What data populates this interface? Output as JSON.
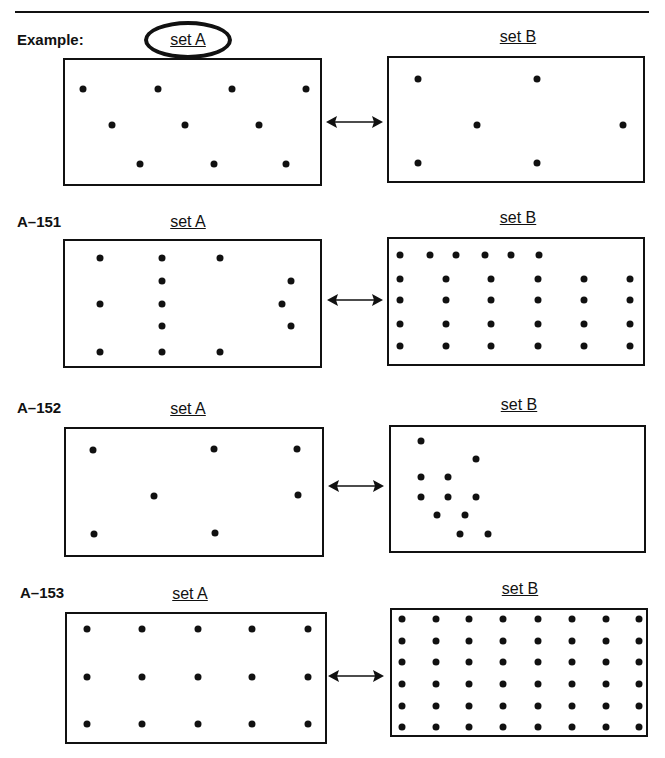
{
  "page": {
    "rule": true
  },
  "problems": [
    {
      "id": "example",
      "label": "Example:",
      "label_pos": [
        17,
        40
      ],
      "setA": {
        "label": "set A",
        "circled": true,
        "label_pos": [
          188,
          40
        ],
        "box": [
          63,
          58,
          259,
          128
        ],
        "dots": [
          [
            83,
            89
          ],
          [
            158,
            89
          ],
          [
            232,
            89
          ],
          [
            306,
            89
          ],
          [
            112,
            125
          ],
          [
            185,
            125
          ],
          [
            259,
            125
          ],
          [
            140,
            164
          ],
          [
            214,
            164
          ],
          [
            286,
            164
          ]
        ]
      },
      "setB": {
        "label": "set B",
        "label_pos": [
          518,
          37
        ],
        "box": [
          387,
          56,
          258,
          127
        ],
        "dots": [
          [
            418,
            79
          ],
          [
            537,
            79
          ],
          [
            477,
            125
          ],
          [
            623,
            125
          ],
          [
            418,
            163
          ],
          [
            537,
            163
          ]
        ]
      },
      "arrow": [
        326,
        122,
        57
      ]
    },
    {
      "id": "A-151",
      "label": "A–151",
      "label_pos": [
        17,
        222
      ],
      "setA": {
        "label": "set A",
        "circled": false,
        "label_pos": [
          188,
          222
        ],
        "box": [
          63,
          239,
          259,
          129
        ],
        "dots": [
          [
            100,
            258
          ],
          [
            162,
            258
          ],
          [
            220,
            258
          ],
          [
            162,
            281
          ],
          [
            291,
            281
          ],
          [
            100,
            304
          ],
          [
            162,
            304
          ],
          [
            282,
            304
          ],
          [
            162,
            326
          ],
          [
            291,
            326
          ],
          [
            100,
            352
          ],
          [
            162,
            352
          ],
          [
            220,
            352
          ]
        ]
      },
      "setB": {
        "label": "set B",
        "label_pos": [
          518,
          218
        ],
        "box": [
          387,
          237,
          258,
          129
        ],
        "dots": [
          [
            400,
            255
          ],
          [
            430,
            255
          ],
          [
            456,
            255
          ],
          [
            485,
            255
          ],
          [
            511,
            255
          ],
          [
            539,
            255
          ],
          [
            400,
            279
          ],
          [
            446,
            279
          ],
          [
            491,
            279
          ],
          [
            538,
            279
          ],
          [
            584,
            279
          ],
          [
            630,
            279
          ],
          [
            400,
            300
          ],
          [
            446,
            300
          ],
          [
            491,
            300
          ],
          [
            538,
            300
          ],
          [
            584,
            300
          ],
          [
            630,
            300
          ],
          [
            400,
            324
          ],
          [
            446,
            324
          ],
          [
            491,
            324
          ],
          [
            538,
            324
          ],
          [
            584,
            324
          ],
          [
            630,
            324
          ],
          [
            400,
            346
          ],
          [
            446,
            346
          ],
          [
            491,
            346
          ],
          [
            538,
            346
          ],
          [
            584,
            346
          ],
          [
            630,
            346
          ]
        ]
      },
      "arrow": [
        327,
        300,
        56
      ]
    },
    {
      "id": "A-152",
      "label": "A–152",
      "label_pos": [
        17,
        408
      ],
      "setA": {
        "label": "set A",
        "circled": false,
        "label_pos": [
          188,
          409
        ],
        "box": [
          64,
          427,
          260,
          130
        ],
        "dots": [
          [
            93,
            450
          ],
          [
            214,
            449
          ],
          [
            297,
            449
          ],
          [
            154,
            496
          ],
          [
            298,
            495
          ],
          [
            94,
            534
          ],
          [
            215,
            533
          ]
        ]
      },
      "setB": {
        "label": "set B",
        "label_pos": [
          519,
          405
        ],
        "box": [
          389,
          425,
          257,
          128
        ],
        "dots": [
          [
            421,
            441
          ],
          [
            476,
            459
          ],
          [
            421,
            477
          ],
          [
            448,
            477
          ],
          [
            421,
            497
          ],
          [
            448,
            497
          ],
          [
            476,
            497
          ],
          [
            437,
            515
          ],
          [
            465,
            515
          ],
          [
            460,
            534
          ],
          [
            488,
            534
          ]
        ]
      },
      "arrow": [
        328,
        486,
        56
      ]
    },
    {
      "id": "A-153",
      "label": "A–153",
      "label_pos": [
        20,
        593
      ],
      "setA": {
        "label": "set A",
        "circled": false,
        "label_pos": [
          190,
          594
        ],
        "box": [
          65,
          612,
          262,
          132
        ],
        "dots": [
          [
            87,
            629
          ],
          [
            142,
            629
          ],
          [
            198,
            629
          ],
          [
            252,
            629
          ],
          [
            308,
            629
          ],
          [
            87,
            677
          ],
          [
            142,
            677
          ],
          [
            198,
            677
          ],
          [
            252,
            677
          ],
          [
            308,
            677
          ],
          [
            87,
            724
          ],
          [
            142,
            724
          ],
          [
            198,
            724
          ],
          [
            252,
            724
          ],
          [
            308,
            724
          ]
        ]
      },
      "setB": {
        "label": "set B",
        "label_pos": [
          520,
          589
        ],
        "box": [
          390,
          608,
          258,
          129
        ],
        "dots_grid": {
          "xs": [
            402,
            436,
            469,
            503,
            538,
            572,
            606,
            639
          ],
          "ys": [
            619,
            641,
            662,
            684,
            706,
            727
          ]
        }
      },
      "arrow": [
        328,
        676,
        56
      ]
    }
  ],
  "counts": {
    "example": {
      "setA": 10,
      "setB": 6
    },
    "A-151": {
      "setA": 13,
      "setB": 30
    },
    "A-152": {
      "setA": 7,
      "setB": 11
    },
    "A-153": {
      "setA": 15,
      "setB": 48
    }
  }
}
